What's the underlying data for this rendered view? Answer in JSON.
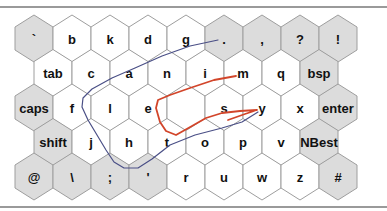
{
  "keyboard": {
    "name": "hexagonal-gesture-keyboard",
    "colors": {
      "letter_key": "#ffffff",
      "function_key": "#dcdcdc",
      "key_border": "#9e9e9e",
      "frame_line": "#9a9a9a",
      "trace_blue": "#4a4f86",
      "trace_red": "#d2452a"
    },
    "rows": [
      {
        "offset": 0,
        "keys": [
          {
            "label": "`",
            "type": "function"
          },
          {
            "label": "b",
            "type": "letter"
          },
          {
            "label": "k",
            "type": "letter"
          },
          {
            "label": "d",
            "type": "letter"
          },
          {
            "label": "g",
            "type": "letter"
          },
          {
            "label": ".",
            "type": "function"
          },
          {
            "label": ",",
            "type": "function"
          },
          {
            "label": "?",
            "type": "function"
          },
          {
            "label": "!",
            "type": "function"
          }
        ]
      },
      {
        "offset": 1,
        "keys": [
          {
            "label": "tab",
            "type": "letter"
          },
          {
            "label": "c",
            "type": "letter"
          },
          {
            "label": "a",
            "type": "letter"
          },
          {
            "label": "n",
            "type": "letter"
          },
          {
            "label": "i",
            "type": "letter"
          },
          {
            "label": "m",
            "type": "letter"
          },
          {
            "label": "q",
            "type": "letter"
          },
          {
            "label": "bsp",
            "type": "function"
          }
        ]
      },
      {
        "offset": 0,
        "keys": [
          {
            "label": "caps",
            "type": "function"
          },
          {
            "label": "f",
            "type": "letter"
          },
          {
            "label": "l",
            "type": "letter"
          },
          {
            "label": "e",
            "type": "letter"
          },
          {
            "label": "",
            "type": "letter"
          },
          {
            "label": "s",
            "type": "letter"
          },
          {
            "label": "y",
            "type": "letter"
          },
          {
            "label": "x",
            "type": "letter"
          },
          {
            "label": "enter",
            "type": "function"
          }
        ]
      },
      {
        "offset": 1,
        "keys": [
          {
            "label": "shift",
            "type": "function"
          },
          {
            "label": "j",
            "type": "letter"
          },
          {
            "label": "h",
            "type": "letter"
          },
          {
            "label": "t",
            "type": "letter"
          },
          {
            "label": "o",
            "type": "letter"
          },
          {
            "label": "p",
            "type": "letter"
          },
          {
            "label": "v",
            "type": "letter"
          },
          {
            "label": "NBest",
            "type": "function"
          }
        ]
      },
      {
        "offset": 0,
        "keys": [
          {
            "label": "@",
            "type": "function"
          },
          {
            "label": "\\",
            "type": "function"
          },
          {
            "label": ";",
            "type": "function"
          },
          {
            "label": "'",
            "type": "function"
          },
          {
            "label": "r",
            "type": "letter"
          },
          {
            "label": "u",
            "type": "letter"
          },
          {
            "label": "w",
            "type": "letter"
          },
          {
            "label": "z",
            "type": "letter"
          },
          {
            "label": "#",
            "type": "function"
          }
        ]
      }
    ],
    "traces": [
      {
        "name": "trace-blue",
        "color": "#4a4f86",
        "points": [
          [
            218,
            40
          ],
          [
            190,
            46
          ],
          [
            162,
            56
          ],
          [
            135,
            68
          ],
          [
            112,
            78
          ],
          [
            92,
            89
          ],
          [
            83,
            98
          ],
          [
            82,
            107
          ],
          [
            88,
            120
          ],
          [
            97,
            135
          ],
          [
            106,
            150
          ],
          [
            114,
            162
          ],
          [
            124,
            168
          ],
          [
            138,
            168
          ],
          [
            152,
            159
          ],
          [
            170,
            145
          ],
          [
            195,
            135
          ],
          [
            222,
            128
          ],
          [
            242,
            122
          ],
          [
            258,
            112
          ]
        ]
      },
      {
        "name": "trace-red",
        "color": "#d2452a",
        "points": [
          [
            236,
            76
          ],
          [
            214,
            80
          ],
          [
            190,
            88
          ],
          [
            170,
            95
          ],
          [
            158,
            100
          ],
          [
            156,
            108
          ],
          [
            160,
            122
          ],
          [
            166,
            131
          ],
          [
            176,
            135
          ],
          [
            192,
            126
          ],
          [
            206,
            118
          ],
          [
            222,
            113
          ],
          [
            240,
            111
          ],
          [
            257,
            110
          ],
          [
            245,
            114
          ],
          [
            228,
            120
          ]
        ]
      }
    ]
  }
}
